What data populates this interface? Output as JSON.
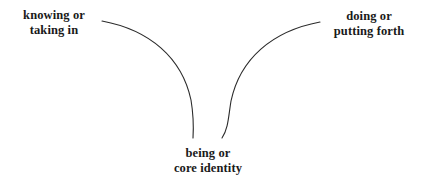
{
  "diagram": {
    "background_color": "#ffffff",
    "stroke_color": "#2b2b2b",
    "text_color": "#1a1a1a",
    "labels": {
      "left": {
        "line1": "knowing or",
        "line2": "taking in"
      },
      "right": {
        "line1": "doing or",
        "line2": "putting forth"
      },
      "bottom": {
        "line1": "being or",
        "line2": "core identity"
      }
    },
    "curves": [
      {
        "name": "left-curve",
        "start": [
          102,
          21
        ],
        "end": [
          193,
          138
        ]
      },
      {
        "name": "right-curve",
        "start": [
          320,
          22
        ],
        "end": [
          222,
          138
        ]
      }
    ]
  }
}
